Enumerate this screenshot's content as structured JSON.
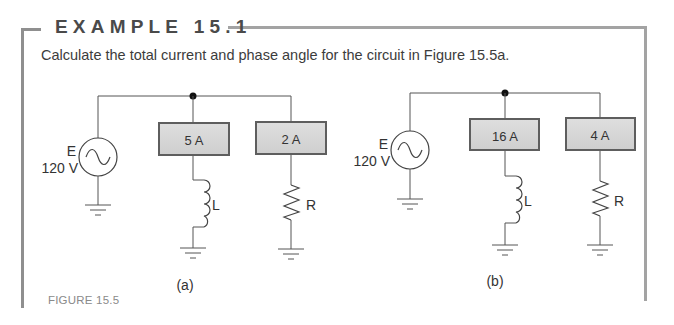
{
  "example": {
    "title": "EXAMPLE 15.1",
    "problem": "Calculate the total current and phase angle for the circuit in Figure 15.5a."
  },
  "figure": {
    "caption": "FIGURE 15.5",
    "circuits": [
      {
        "id": "a",
        "label": "(a)",
        "source": {
          "name": "E",
          "voltage": "120 V",
          "icon": "ac-source-icon"
        },
        "branches": [
          {
            "meter": "5 A",
            "component": "L",
            "icon": "inductor-icon"
          },
          {
            "meter": "2 A",
            "component": "R",
            "icon": "resistor-icon"
          }
        ]
      },
      {
        "id": "b",
        "label": "(b)",
        "source": {
          "name": "E",
          "voltage": "120 V",
          "icon": "ac-source-icon"
        },
        "branches": [
          {
            "meter": "16 A",
            "component": "L",
            "icon": "inductor-icon"
          },
          {
            "meter": "4 A",
            "component": "R",
            "icon": "resistor-icon"
          }
        ]
      }
    ]
  },
  "colors": {
    "frame": "#8f8f8f",
    "meter_fill": "#d6d6d6",
    "meter_border": "#4a4a4a",
    "wire": "#555555"
  }
}
